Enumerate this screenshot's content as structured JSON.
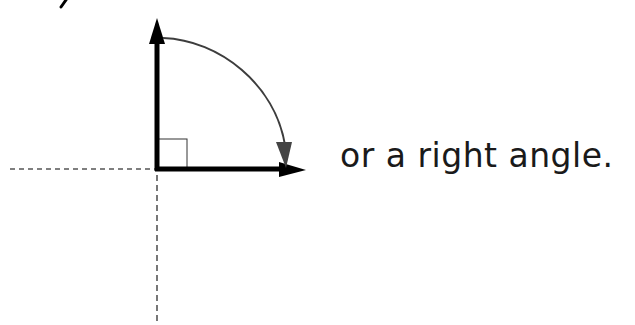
{
  "caption": "or a right angle.",
  "colors": {
    "axis": "#000000",
    "arc": "#3d3d3d",
    "dashed": "#555555",
    "right_angle_box": "#333333",
    "background": "#ffffff"
  },
  "diagram": {
    "origin": [
      157,
      169
    ],
    "vertical_arrow_tip": [
      157,
      18
    ],
    "horizontal_arrow_tip": [
      306,
      169
    ],
    "arc": {
      "from": "vertical arm",
      "to": "horizontal arm",
      "direction": "clockwise",
      "angle_degrees": 90
    },
    "right_angle_marker": true,
    "dashed_lines": [
      "negative x axis",
      "negative y axis"
    ]
  }
}
